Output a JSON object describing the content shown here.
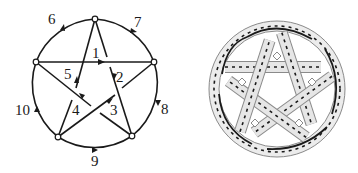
{
  "left_diagram": {
    "type": "directed-graph-pentagram-in-circle",
    "vertices": 5,
    "edge_labels": {
      "e1": "1",
      "e2": "2",
      "e3": "3",
      "e4": "4",
      "e5": "5",
      "e6": "6",
      "e7": "7",
      "e8": "8",
      "e9": "9",
      "e10": "10"
    },
    "colors": {
      "stroke": "#1a1a1a",
      "vertex_fill": "#ffffff"
    }
  },
  "right_diagram": {
    "type": "knot-ribbon-pentagram-in-circle",
    "colors": {
      "ribbon_fill": "#e6e6e6",
      "ribbon_edge": "#8a8a8a",
      "core_line": "#1a1a1a"
    }
  }
}
